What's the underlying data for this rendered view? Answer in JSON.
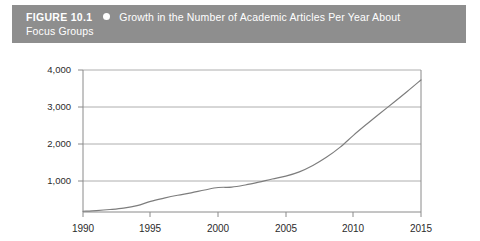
{
  "figure": {
    "label": "FIGURE 10.1",
    "bullet_icon": "circle-bullet-icon",
    "title_line1": "Growth in the Number of Academic Articles Per Year About",
    "title_line2": "Focus Groups",
    "caption_bar_color": "#8e8e8e",
    "caption_text_color": "#ffffff"
  },
  "chart_data": {
    "type": "line",
    "title": "Growth in the Number of Academic Articles Per Year About Focus Groups",
    "xlabel": "",
    "ylabel": "",
    "xlim": [
      1990,
      2015
    ],
    "ylim": [
      0,
      4000
    ],
    "grid": true,
    "legend": "none",
    "line_color": "#7d7d7d",
    "x_ticks": [
      1990,
      1995,
      2000,
      2005,
      2010,
      2015
    ],
    "x_tick_labels": [
      "1990",
      "1995",
      "2000",
      "2005",
      "2010",
      "2015"
    ],
    "y_ticks": [
      1000,
      2000,
      3000,
      4000
    ],
    "y_tick_labels": [
      "1,000",
      "2,000",
      "3,000",
      "4,000"
    ],
    "x": [
      1990,
      1991,
      1992,
      1993,
      1994,
      1995,
      1996,
      1997,
      1998,
      1999,
      2000,
      2001,
      2002,
      2003,
      2004,
      2005,
      2006,
      2007,
      2008,
      2009,
      2010,
      2011,
      2012,
      2013,
      2014,
      2015
    ],
    "values": [
      20,
      40,
      70,
      110,
      180,
      300,
      390,
      470,
      540,
      620,
      690,
      700,
      760,
      840,
      930,
      1010,
      1130,
      1310,
      1540,
      1820,
      2160,
      2480,
      2790,
      3090,
      3400,
      3720
    ],
    "series": [
      {
        "name": "Academic articles per year about focus groups",
        "values": [
          20,
          40,
          70,
          110,
          180,
          300,
          390,
          470,
          540,
          620,
          690,
          700,
          760,
          840,
          930,
          1010,
          1130,
          1310,
          1540,
          1820,
          2160,
          2480,
          2790,
          3090,
          3400,
          3720
        ]
      }
    ]
  }
}
